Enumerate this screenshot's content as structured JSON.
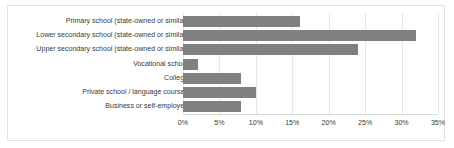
{
  "chart_data": {
    "type": "bar",
    "orientation": "horizontal",
    "title": "",
    "xlabel": "",
    "ylabel": "",
    "xlim": [
      0,
      35
    ],
    "grid": true,
    "legend": false,
    "bar_color": "#808080",
    "categories": [
      "Primary school (state-owned or similar)",
      "Lower secondary school (state-owned or similar)",
      "Upper secondary school (state-owned or similar)",
      "Vocational school",
      "College",
      "Private school / language courses",
      "Business or self-employed"
    ],
    "values": [
      16,
      32,
      24,
      2,
      8,
      10,
      8
    ],
    "xticks": [
      0,
      5,
      10,
      15,
      20,
      25,
      30,
      35
    ],
    "xtick_labels": [
      "0%",
      "5%",
      "10%",
      "15%",
      "20%",
      "25%",
      "30%",
      "35%"
    ]
  }
}
